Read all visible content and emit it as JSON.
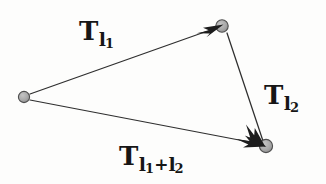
{
  "figure": {
    "background_color": "#fdfdfc",
    "ink_color": "#2a2a2a",
    "node_fill_color": "#a9a9a9",
    "node_stroke_color": "#4a4a4a",
    "label_color": "#161616"
  },
  "nodes": [
    {
      "id": "origin",
      "name": "origin-node",
      "x": 24,
      "y": 97,
      "r": 5.5
    },
    {
      "id": "intermediate",
      "name": "intermediate-node",
      "x": 222,
      "y": 26,
      "r": 6.0
    },
    {
      "id": "terminal",
      "name": "terminal-node",
      "x": 266,
      "y": 146,
      "r": 6.5
    }
  ],
  "edges": [
    {
      "id": "edge-t-l1",
      "name": "edge-origin-to-intermediate",
      "from": "origin",
      "to": "intermediate",
      "x1": 30,
      "y1": 94,
      "x2": 215,
      "y2": 28,
      "arrowhead": true
    },
    {
      "id": "edge-t-l2",
      "name": "edge-intermediate-to-terminal",
      "from": "intermediate",
      "to": "terminal",
      "x1": 227,
      "y1": 33,
      "x2": 262,
      "y2": 140,
      "arrowhead": true
    },
    {
      "id": "edge-t-l1-l2",
      "name": "edge-origin-to-terminal",
      "from": "origin",
      "to": "terminal",
      "x1": 30,
      "y1": 100,
      "x2": 259,
      "y2": 144,
      "arrowhead": true
    }
  ],
  "labels": {
    "t_l1": {
      "base": "T",
      "sub": "l",
      "subsub": "1"
    },
    "t_l2": {
      "base": "T",
      "sub": "l",
      "subsub": "2"
    },
    "t_l1_plus_l2": {
      "base": "T",
      "sub_a": "l",
      "subsub_a": "1",
      "operator": "+",
      "sub_b": "l",
      "subsub_b": "2"
    }
  }
}
